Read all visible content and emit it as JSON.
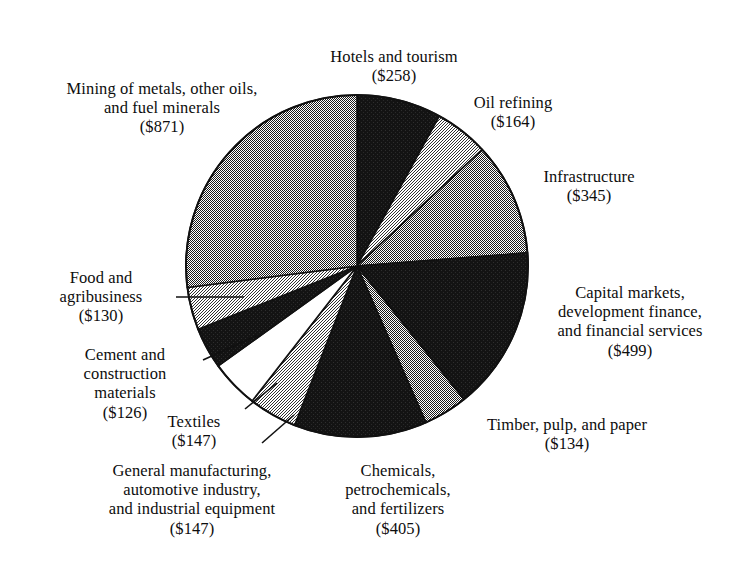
{
  "chart_data": {
    "type": "pie",
    "title": "",
    "subtitle": "",
    "unit": "US$ millions",
    "total": 3226,
    "start_angle_deg": 0,
    "direction": "clockwise",
    "legend": "none",
    "labels_placement": "outside-with-leader-lines",
    "categories": [
      "Hotels and tourism",
      "Oil refining",
      "Infrastructure",
      "Capital markets, development finance, and financial services",
      "Timber, pulp, and paper",
      "Chemicals, petrochemicals, and fertilizers",
      "General manufacturing, automotive industry, and industrial equipment",
      "Textiles",
      "Cement and construction materials",
      "Food and agribusiness",
      "Mining of metals, other oils, and fuel minerals"
    ],
    "values": [
      258,
      164,
      345,
      499,
      134,
      405,
      147,
      147,
      126,
      130,
      871
    ],
    "value_labels": [
      "($258)",
      "($164)",
      "($345)",
      "($499)",
      "($134)",
      "($405)",
      "($147)",
      "($147)",
      "($126)",
      "($130)",
      "($871)"
    ],
    "slice_fills": [
      "black",
      "light-gray",
      "medium-gray",
      "black",
      "medium-gray",
      "black",
      "light-gray",
      "white",
      "black",
      "light-gray",
      "medium-gray"
    ],
    "colors": {
      "black": "#111111",
      "medium-gray": "#7c7c7c",
      "light-gray": "#d9d9d9",
      "white": "#ffffff",
      "outline": "#111111",
      "text": "#0d0d0d",
      "background": "#ffffff"
    }
  },
  "labels": {
    "hotels": {
      "name": "Hotels and tourism",
      "value": "($258)"
    },
    "oil": {
      "name": "Oil refining",
      "value": "($164)"
    },
    "infra": {
      "name": "Infrastructure",
      "value": "($345)"
    },
    "capital": {
      "name": "Capital markets,\ndevelopment finance,\nand financial services",
      "value": "($499)"
    },
    "timber": {
      "name": "Timber, pulp, and paper",
      "value": "($134)"
    },
    "chemicals": {
      "name": "Chemicals,\npetrochemicals,\nand fertilizers",
      "value": "($405)"
    },
    "genmfg": {
      "name": "General manufacturing,\nautomotive industry,\nand industrial equipment",
      "value": "($147)"
    },
    "textiles": {
      "name": "Textiles",
      "value": "($147)"
    },
    "cement": {
      "name": "Cement and\nconstruction\nmaterials",
      "value": "($126)"
    },
    "food": {
      "name": "Food and\nagribusiness",
      "value": "($130)"
    },
    "mining": {
      "name": "Mining of metals, other oils,\nand fuel minerals",
      "value": "($871)"
    }
  }
}
